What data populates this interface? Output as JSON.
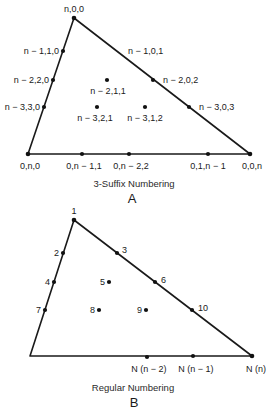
{
  "diagram_a": {
    "caption": "3-Suffix Numbering",
    "letter": "A",
    "labels": {
      "apex": "n,0,0",
      "left1": "n − 1,1,0",
      "left2": "n − 2,2,0",
      "left3": "n − 3,3,0",
      "right1": "n − 1,0,1",
      "right2": "n − 2,0,2",
      "right3": "n − 3,0,3",
      "int1": "n − 2,1,1",
      "int2": "n − 3,2,1",
      "int3": "n − 3,1,2",
      "bl": "0,n,0",
      "b1": "0,n − 1,1",
      "b2": "0,n − 2,2",
      "b3": "0,1,n − 1",
      "br": "0,0,n"
    }
  },
  "diagram_b": {
    "caption": "Regular Numbering",
    "letter": "B",
    "labels": {
      "n1": "1",
      "n2": "2",
      "n3": "3",
      "n4": "4",
      "n5": "5",
      "n6": "6",
      "n7": "7",
      "n8": "8",
      "n9": "9",
      "n10": "10",
      "b1": "N (n − 2)",
      "b2": "N (n − 1)",
      "br": "N (n)"
    }
  }
}
